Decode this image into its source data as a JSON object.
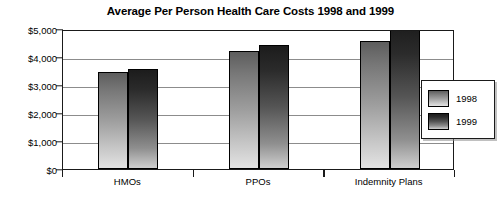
{
  "chart_data": {
    "type": "bar",
    "title": "Average Per Person Health Care Costs 1998 and 1999",
    "xlabel": "",
    "ylabel": "",
    "categories": [
      "HMOs",
      "PPOs",
      "Indemnity Plans"
    ],
    "series": [
      {
        "name": "1998",
        "values": [
          3480,
          4220,
          4560
        ],
        "color": "#9e9e9e"
      },
      {
        "name": "1999",
        "values": [
          3580,
          4420,
          5100
        ],
        "color": "#3d3d3d"
      }
    ],
    "ylim": [
      0,
      5000
    ],
    "ytick_values": [
      0,
      1000,
      2000,
      3000,
      4000,
      5000
    ],
    "ytick_labels": [
      "$0",
      "$1,000",
      "$2,000",
      "$3,000",
      "$4,000",
      "$5,000"
    ],
    "grid": true,
    "legend_position": "right-inside"
  },
  "legend": {
    "entries": [
      {
        "label": "1998"
      },
      {
        "label": "1999"
      }
    ]
  }
}
